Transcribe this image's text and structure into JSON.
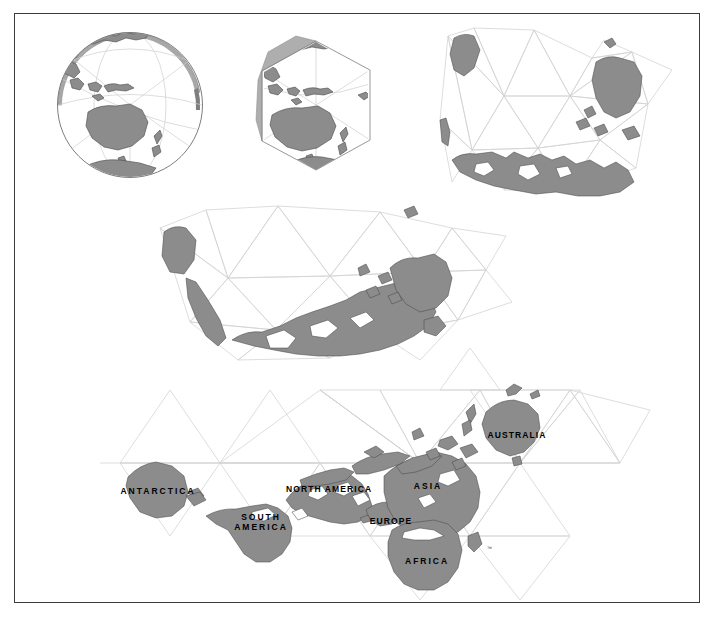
{
  "figure": {
    "border_color": "#3b3b3b",
    "background_color": "#ffffff",
    "land_fill_color": "#8c8c8c",
    "land_stroke_color": "#4a4a4a",
    "grid_line_color": "#d8d8d8",
    "sphere_edge_color": "#9a9a9a",
    "trademark_symbol": "™"
  },
  "stages": [
    {
      "id": "stage-1-sphere",
      "name": "spherical-globe",
      "center_x": 130,
      "center_y": 105,
      "radius": 73
    },
    {
      "id": "stage-2-icosahedron",
      "name": "faceted-icosahedron-globe",
      "center_x": 316,
      "center_y": 106,
      "radius": 64
    },
    {
      "id": "stage-3-partial-unfold",
      "name": "partially-unfolded-icosahedron",
      "center_x": 552,
      "center_y": 110
    },
    {
      "id": "stage-4-more-unfold",
      "name": "further-unfolded-icosahedron",
      "center_x": 335,
      "center_y": 285
    },
    {
      "id": "stage-5-flat-map",
      "name": "flat-dymaxion-world-map",
      "center_x": 390,
      "center_y": 490
    }
  ],
  "continent_labels": [
    {
      "key": "antarctica",
      "text": "ANTARCTICA",
      "lines": [
        "ANTARCTICA"
      ],
      "x": 122,
      "y": 486,
      "width": 72,
      "spacing": "wide"
    },
    {
      "key": "south_america",
      "text": "SOUTH AMERICA",
      "lines": [
        "SOUTH",
        "AMERICA"
      ],
      "x": 230,
      "y": 513,
      "width": 62,
      "spacing": "wide"
    },
    {
      "key": "north_america",
      "text": "NORTH AMERICA",
      "lines": [
        "NORTH AMERICA"
      ],
      "x": 286,
      "y": 484,
      "width": 74,
      "spacing": "normal"
    },
    {
      "key": "europe",
      "text": "EUROPE",
      "lines": [
        "EUROPE"
      ],
      "x": 370,
      "y": 516,
      "width": 42,
      "spacing": "normal"
    },
    {
      "key": "asia",
      "text": "ASIA",
      "lines": [
        "ASIA"
      ],
      "x": 409,
      "y": 481,
      "width": 38,
      "spacing": "wide"
    },
    {
      "key": "africa",
      "text": "AFRICA",
      "lines": [
        "AFRICA"
      ],
      "x": 406,
      "y": 556,
      "width": 42,
      "spacing": "wide"
    },
    {
      "key": "australia",
      "text": "AUSTRALIA",
      "lines": [
        "AUSTRALIA"
      ],
      "x": 486,
      "y": 430,
      "width": 62,
      "spacing": "normal"
    }
  ],
  "trademark": {
    "text": "™",
    "x": 487,
    "y": 545
  }
}
